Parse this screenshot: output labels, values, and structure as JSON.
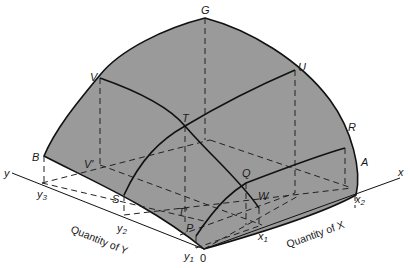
{
  "figure": {
    "type": "3D production surface diagram (isoquants)",
    "colors": {
      "surface_fill": "#9a9a9a",
      "outline": "#111111",
      "dashed": "#222222",
      "background": "#ffffff"
    }
  },
  "axes": {
    "x": {
      "label": "x",
      "title": "Quantity of X",
      "ticks": [
        "x1",
        "x2"
      ]
    },
    "y": {
      "label": "y",
      "title": "Quantity of Y",
      "ticks": [
        "y1",
        "y2",
        "y3"
      ]
    },
    "origin": "0"
  },
  "points": {
    "G": "G",
    "V": "V",
    "U": "U",
    "T": "T",
    "R": "R",
    "B": "B",
    "V_prime": "V'",
    "A": "A",
    "Q": "Q",
    "S": "S",
    "W": "W",
    "T_prime": "T'",
    "P": "P"
  },
  "ticks": {
    "x1": "x",
    "x1_sub": "1",
    "x2": "x",
    "x2_sub": "2",
    "y1": "y",
    "y1_sub": "1",
    "y2": "y",
    "y2_sub": "2",
    "y3": "y",
    "y3_sub": "3"
  }
}
